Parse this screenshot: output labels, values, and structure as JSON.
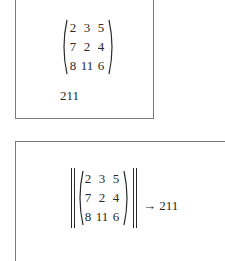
{
  "input_cell": {
    "matrix": [
      [
        "2",
        "3",
        "5"
      ],
      [
        "7",
        "2",
        "4"
      ],
      [
        "8",
        "11",
        "6"
      ]
    ],
    "output": "211"
  },
  "output_cell": {
    "matrix": [
      [
        "2",
        "3",
        "5"
      ],
      [
        "7",
        "2",
        "4"
      ],
      [
        "8",
        "11",
        "6"
      ]
    ],
    "arrow": "→",
    "result": "211"
  },
  "colors": {
    "border": "#7a7a7a",
    "text": "#2a2a2a"
  }
}
